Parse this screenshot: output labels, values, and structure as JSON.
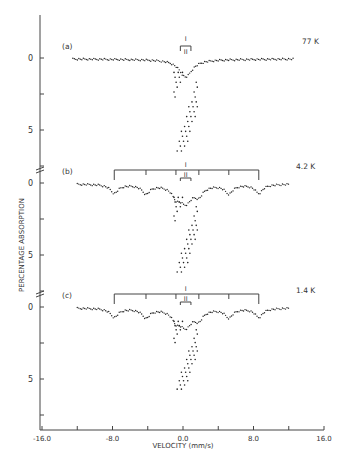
{
  "chart_data": {
    "type": "scatter",
    "title": "",
    "xlabel": "VELOCITY (mm/s)",
    "ylabel": "PERCENTAGE ABSORPTION",
    "xlim": [
      -16.0,
      16.0
    ],
    "x_ticks": [
      "-16.0",
      "-8.0",
      "0.0",
      "8.0",
      "16.0"
    ],
    "x_tick_values": [
      -16,
      -12,
      -8,
      -4,
      0,
      4,
      8,
      12,
      16
    ],
    "y_ticks": [
      "0",
      "5"
    ],
    "grid": false,
    "legend": null,
    "panels": [
      {
        "label": "(a)",
        "temperature": "77 K",
        "baseline": 0,
        "ylim": [
          0,
          7
        ],
        "annotations": [
          "I",
          "II"
        ],
        "sextet_I_lines": [],
        "center_dip_velocity": 0.3,
        "center_dip_depth": 6.8,
        "series": [
          {
            "name": "77 K spectrum",
            "x": [
              -12.5,
              -10,
              -8,
              -6,
              -4,
              -2,
              -1,
              -0.5,
              0,
              0.5,
              1,
              2,
              4,
              6,
              8,
              10,
              12.5
            ],
            "y": [
              0.0,
              0.1,
              0.15,
              0.2,
              0.25,
              0.5,
              1.5,
              3.5,
              6.8,
              5.0,
              1.5,
              0.5,
              0.3,
              0.2,
              0.15,
              0.1,
              0.0
            ]
          }
        ]
      },
      {
        "label": "(b)",
        "temperature": "4.2 K",
        "baseline": 0,
        "ylim": [
          0,
          7
        ],
        "annotations": [
          "I",
          "II"
        ],
        "sextet_I_lines": [
          -7.8,
          -4.2,
          -0.8,
          1.8,
          5.2,
          8.6
        ],
        "center_dip_velocity": 0.3,
        "center_dip_depth": 6.5,
        "series": [
          {
            "name": "4.2 K spectrum",
            "x": [
              -12,
              -10,
              -7.8,
              -6,
              -4.2,
              -3,
              -2,
              -1,
              0,
              1,
              2,
              3,
              5.2,
              7,
              8.6,
              10,
              12
            ],
            "y": [
              0.0,
              0.1,
              0.8,
              0.3,
              0.8,
              0.4,
              0.8,
              3.0,
              6.5,
              3.0,
              0.8,
              0.4,
              0.8,
              0.3,
              0.8,
              0.2,
              0.0
            ]
          }
        ]
      },
      {
        "label": "(c)",
        "temperature": "1.4 K",
        "baseline": 0,
        "ylim": [
          0,
          7
        ],
        "annotations": [
          "I",
          "II"
        ],
        "sextet_I_lines": [
          -7.8,
          -4.2,
          -0.8,
          1.8,
          5.2,
          8.6
        ],
        "center_dip_velocity": 0.3,
        "center_dip_depth": 6.0,
        "series": [
          {
            "name": "1.4 K spectrum",
            "x": [
              -12,
              -10,
              -7.8,
              -6,
              -4.2,
              -3,
              -2,
              -1,
              0,
              1,
              2,
              3,
              5.2,
              7,
              8.6,
              10,
              12
            ],
            "y": [
              0.0,
              0.2,
              0.9,
              0.4,
              0.8,
              0.4,
              0.8,
              3.0,
              6.0,
              3.0,
              0.8,
              0.4,
              0.8,
              0.4,
              0.9,
              0.2,
              0.0
            ]
          }
        ]
      }
    ]
  }
}
